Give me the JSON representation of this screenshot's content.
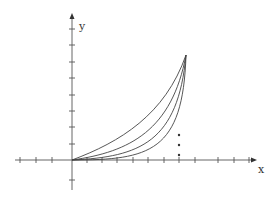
{
  "figure": {
    "x_axis": {
      "label": "x",
      "has_arrow": true,
      "tick_count_negative": 3,
      "tick_count_positive": 12
    },
    "y_axis": {
      "label": "y",
      "has_arrow": true,
      "tick_count_positive": 8,
      "tick_count_negative": 1
    },
    "curves": {
      "count": 4,
      "start": "origin",
      "end": "common peak point",
      "shape": "convex increasing"
    },
    "ellipsis": {
      "dots": 3,
      "orientation": "vertical"
    },
    "colors": {
      "axis": "#555555",
      "curve": "#444444",
      "background": "#ffffff"
    }
  }
}
